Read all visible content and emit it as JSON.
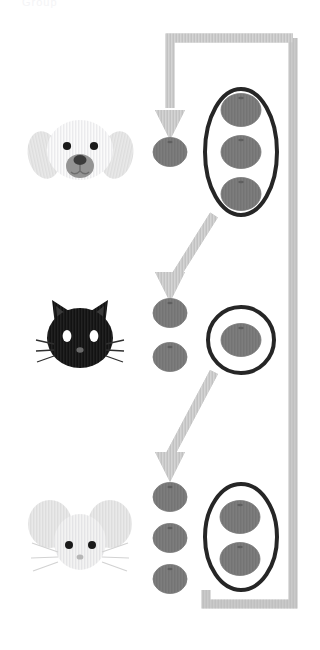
{
  "page": {
    "width": 320,
    "height": 650,
    "background": "#ffffff",
    "faint_header_text": "Group"
  },
  "colors": {
    "background": "#ffffff",
    "arrow_gray": "#bcbcbc",
    "arrow_gray_light": "#c8c8c8",
    "ellipse_fill": "#808080",
    "ellipse_stroke": "#6f6f6f",
    "ring_outline": "#262626",
    "dog_face": "#fafafa",
    "dog_ear": "#e4e4e4",
    "dog_nose": "#8c8c8c",
    "cat_face": "#111111",
    "cat_eye": "#ffffff",
    "mouse_face": "#f1f1f1",
    "mouse_ear": "#e6e6e6",
    "eye_dark": "#1a1a1a"
  },
  "rows": [
    {
      "id": "row-dog",
      "animal": "dog",
      "animal_label": "Dog",
      "animal_face_icon": "dog-face-icon",
      "loose_count": 1,
      "loose_labels": [
        "1"
      ],
      "grouped_count": 3,
      "grouped_labels": [
        "1",
        "2",
        "3"
      ],
      "group_shape": "tall-oval",
      "total": 4,
      "y_center": 152
    },
    {
      "id": "row-cat",
      "animal": "cat",
      "animal_label": "Cat",
      "animal_face_icon": "cat-face-icon",
      "loose_count": 2,
      "loose_labels": [
        "1",
        "2"
      ],
      "grouped_count": 1,
      "grouped_labels": [
        "1"
      ],
      "group_shape": "circle",
      "total": 3,
      "y_center": 338
    },
    {
      "id": "row-mouse",
      "animal": "mouse",
      "animal_label": "Mouse",
      "animal_face_icon": "mouse-face-icon",
      "loose_count": 3,
      "loose_labels": [
        "1",
        "2",
        "3"
      ],
      "grouped_count": 2,
      "grouped_labels": [
        "1",
        "2"
      ],
      "group_shape": "tall-oval",
      "total": 5,
      "y_center": 532
    }
  ],
  "flow": {
    "description": "Gray path starts at top right, runs left along the top, turns down as an arrow into the dog row, continues diagonally down-left into the cat row, then down into the mouse row; a vertical bar on the right connects top to bottom.",
    "arrows": [
      {
        "name": "arrow-to-dog",
        "direction": "down",
        "target_row": "row-dog"
      },
      {
        "name": "arrow-to-cat",
        "direction": "down-left",
        "target_row": "row-cat"
      },
      {
        "name": "arrow-to-mouse",
        "direction": "down-left",
        "target_row": "row-mouse"
      }
    ],
    "rail": {
      "name": "right-rail",
      "top_y": 38,
      "bottom_y": 604,
      "left_x": 170,
      "right_x": 293,
      "thickness": 9
    }
  }
}
